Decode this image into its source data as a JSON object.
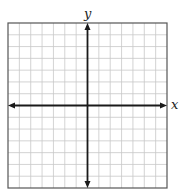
{
  "diagram": {
    "type": "coordinate-plane",
    "grid": {
      "columns": 14,
      "rows": 14,
      "left": 8,
      "top": 23,
      "right": 167,
      "bottom": 188,
      "line_color": "#c8c8c8",
      "border_color": "#555555"
    },
    "axes": {
      "x_label": "x",
      "y_label": "y",
      "origin_column": 7,
      "origin_row": 7,
      "axis_color": "#1a1a1a",
      "x_axis_arrows": "both",
      "y_axis_arrows": "both"
    }
  }
}
